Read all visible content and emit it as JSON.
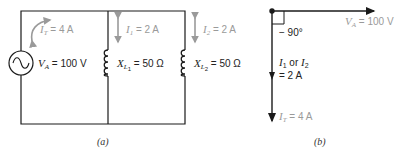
{
  "circuit_a": {
    "caption": "(a)",
    "source": {
      "symbol": "V",
      "sub": "A",
      "value": "= 100 V"
    },
    "total_current": {
      "symbol": "I",
      "sub": "T",
      "value": "= 4 A"
    },
    "branch1_current": {
      "symbol": "I",
      "sub": "1",
      "value": "= 2 A"
    },
    "branch2_current": {
      "symbol": "I",
      "sub": "2",
      "value": "= 2 A"
    },
    "inductor1": {
      "symbol": "X",
      "sub": "L",
      "subsub": "1",
      "value": "= 50 Ω"
    },
    "inductor2": {
      "symbol": "X",
      "sub": "L",
      "subsub": "2",
      "value": "= 50 Ω"
    }
  },
  "phasor_b": {
    "caption": "(b)",
    "reference": {
      "symbol": "V",
      "sub": "A",
      "value": "= 100 V"
    },
    "angle": "− 90°",
    "branch": {
      "symbol1": "I",
      "sub1": "1",
      "or": "or",
      "symbol2": "I",
      "sub2": "2",
      "value": "= 2 A"
    },
    "total": {
      "symbol": "I",
      "sub": "T",
      "value": "= 4 A"
    }
  },
  "colors": {
    "line": "#1a1a1a",
    "annotation": "#9a9a9a"
  }
}
